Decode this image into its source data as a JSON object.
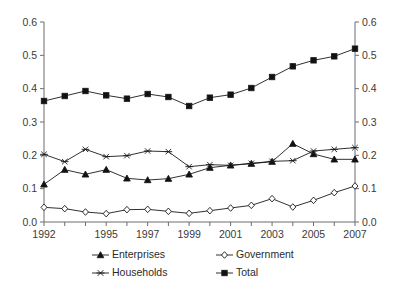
{
  "chart_data": {
    "type": "line",
    "title": "",
    "subtitle": "",
    "xlabel": "",
    "ylabel": "",
    "ylim": [
      0.0,
      0.6
    ],
    "xlim": [
      1992,
      2007
    ],
    "grid": false,
    "legend_position": "bottom",
    "dual_y_axis": true,
    "y_ticks": [
      "0.0",
      "0.1",
      "0.2",
      "0.3",
      "0.4",
      "0.5",
      "0.6"
    ],
    "y_tick_values": [
      0.0,
      0.1,
      0.2,
      0.3,
      0.4,
      0.5,
      0.6
    ],
    "y_ticks_right": [
      "0.0",
      "0.1",
      "0.2",
      "0.3",
      "0.4",
      "0.5",
      "0.6"
    ],
    "x": [
      1992,
      1993,
      1994,
      1995,
      1996,
      1997,
      1998,
      1999,
      2000,
      2001,
      2002,
      2003,
      2004,
      2005,
      2006,
      2007
    ],
    "x_tick_labels": [
      "1992",
      "",
      "",
      "1995",
      "",
      "1997",
      "",
      "1999",
      "",
      "2001",
      "",
      "2003",
      "",
      "2005",
      "",
      "2007"
    ],
    "series": [
      {
        "name": "Enterprises",
        "marker": "filled-triangle",
        "values": [
          0.113,
          0.157,
          0.143,
          0.157,
          0.131,
          0.126,
          0.13,
          0.143,
          0.163,
          0.17,
          0.175,
          0.181,
          0.235,
          0.204,
          0.188,
          0.188
        ]
      },
      {
        "name": "Government",
        "marker": "open-diamond",
        "values": [
          0.044,
          0.04,
          0.03,
          0.025,
          0.037,
          0.038,
          0.032,
          0.026,
          0.034,
          0.042,
          0.05,
          0.07,
          0.045,
          0.065,
          0.088,
          0.108
        ]
      },
      {
        "name": "Households",
        "marker": "asterisk",
        "values": [
          0.203,
          0.181,
          0.218,
          0.196,
          0.199,
          0.213,
          0.211,
          0.166,
          0.172,
          0.17,
          0.176,
          0.182,
          0.184,
          0.213,
          0.218,
          0.223
        ]
      },
      {
        "name": "Total",
        "marker": "filled-square",
        "values": [
          0.363,
          0.378,
          0.393,
          0.38,
          0.37,
          0.384,
          0.375,
          0.348,
          0.373,
          0.382,
          0.402,
          0.435,
          0.467,
          0.485,
          0.497,
          0.52
        ]
      }
    ],
    "legend": [
      {
        "label": "Enterprises",
        "marker": "filled-triangle"
      },
      {
        "label": "Government",
        "marker": "open-diamond"
      },
      {
        "label": "Households",
        "marker": "asterisk"
      },
      {
        "label": "Total",
        "marker": "filled-square"
      }
    ],
    "colors": {
      "line": "#1a1a1a",
      "axis": "#6d6d6d",
      "text": "#3a3a3a",
      "background": "#ffffff"
    }
  }
}
